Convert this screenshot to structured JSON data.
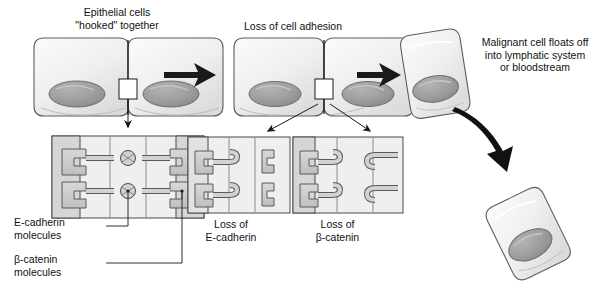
{
  "figure": {
    "type": "diagram",
    "background_color": "#ffffff",
    "line_color": "#1a1a1a",
    "cell_fill": "#f2f2f2",
    "nucleus_fill": "#9a9a9a",
    "protein_fill": "#c9c9c9",
    "panel_fill": "#efefef",
    "panel_shade": "#d6d6d6"
  },
  "captions": {
    "stage1": "Epithelial cells\n\"hooked\" together",
    "stage2": "Loss of cell adhesion",
    "stage3": "Malignant cell floats off\ninto lymphatic system\nor bloodstream",
    "panel_loss_cadherin": "Loss of\nE-cadherin",
    "panel_loss_catenin": "Loss of\nβ-catenin"
  },
  "labels": {
    "e_cadherin": "E-cadherin\nmolecules",
    "beta_catenin": "β-catenin\nmolecules"
  },
  "junction_panels": [
    {
      "name": "intact-junction",
      "cadherin_linked": true,
      "catenin_present": true
    },
    {
      "name": "loss-of-e-cadherin",
      "cadherin_linked": false,
      "catenin_present": false
    },
    {
      "name": "loss-of-beta-catenin",
      "cadherin_linked": true,
      "catenin_present": false
    }
  ],
  "cells": [
    {
      "name": "epithelial-cell-pair-left",
      "count": 2,
      "state": "adhered"
    },
    {
      "name": "epithelial-cell-pair-middle",
      "count": 2,
      "state": "losing-adhesion"
    },
    {
      "name": "malignant-cell-detached",
      "count": 1,
      "state": "detached"
    },
    {
      "name": "malignant-cell-floating",
      "count": 1,
      "state": "floating"
    }
  ],
  "arrows": [
    {
      "name": "arrow-stage1-to-stage2",
      "style": "thick-straight"
    },
    {
      "name": "arrow-stage2-to-stage3",
      "style": "thick-straight"
    },
    {
      "name": "arrow-junction-callout",
      "style": "thin-down"
    },
    {
      "name": "arrow-split-left",
      "style": "thin-diagonal"
    },
    {
      "name": "arrow-split-right",
      "style": "thin-diagonal"
    },
    {
      "name": "arrow-float-off",
      "style": "thick-curved"
    }
  ]
}
